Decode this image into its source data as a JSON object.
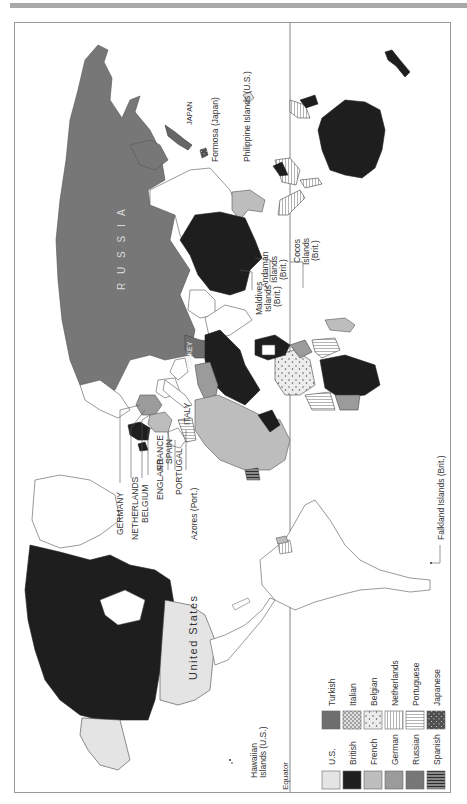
{
  "figure": {
    "type": "thematic-world-map",
    "orientation": "rotated 90deg counter-clockwise (north points left)"
  },
  "colors": {
    "us": "#e4e4e4",
    "british": "#1e1e1e",
    "french": "#bdbdbd",
    "german": "#9b9b9b",
    "russian": "#777777",
    "turkish": "#6e6e6e",
    "italian": "#d8d8d8",
    "belgian": "#e6e6e6",
    "netherlands": "#ffffff",
    "portuguese": "#ffffff",
    "japanese": "#555555",
    "spanish": "#7a7a7a",
    "unclaimed": "#ffffff",
    "outline": "#444444",
    "frame": "#9a9a9a"
  },
  "labels": {
    "russia": "R U S S I A",
    "united_states": "United States",
    "turkey": "TURKEY",
    "italy": "ITALY",
    "japan": "JAPAN",
    "formosa": "Formosa (Japan)",
    "philippines": "Philippine Islands (U.S.)",
    "germany": "GERMANY",
    "netherlands": "NETHERLANDS",
    "belgium": "BELGIUM",
    "england": "ENGLAND",
    "france": "FRANCE",
    "spain": "SPAIN",
    "portugal": "PORTUGAL",
    "azores": "Azores (Port.)",
    "maldives": [
      "Maldives",
      "Islands",
      "(Brit.)"
    ],
    "andaman": [
      "Andaman",
      "Islands",
      "(Brit.)"
    ],
    "cocos": [
      "Cocos",
      "Islands",
      "(Brit.)"
    ],
    "falkland": "Falkland Islands (Brit.)",
    "hawaii": [
      "Hawaiian",
      "Islands (U.S.)"
    ],
    "equator": "Equator"
  },
  "legend": {
    "left_column": [
      {
        "label": "U.S.",
        "pattern": "us"
      },
      {
        "label": "British",
        "pattern": "british"
      },
      {
        "label": "French",
        "pattern": "french"
      },
      {
        "label": "German",
        "pattern": "german"
      },
      {
        "label": "Russian",
        "pattern": "russian"
      },
      {
        "label": "Spanish",
        "pattern": "spanish"
      }
    ],
    "right_column": [
      {
        "label": "Turkish",
        "pattern": "turkish"
      },
      {
        "label": "Italian",
        "pattern": "italian"
      },
      {
        "label": "Belgian",
        "pattern": "belgian"
      },
      {
        "label": "Netherlands",
        "pattern": "netherlands"
      },
      {
        "label": "Portuguese",
        "pattern": "portuguese"
      },
      {
        "label": "Japanese",
        "pattern": "japanese"
      }
    ]
  }
}
